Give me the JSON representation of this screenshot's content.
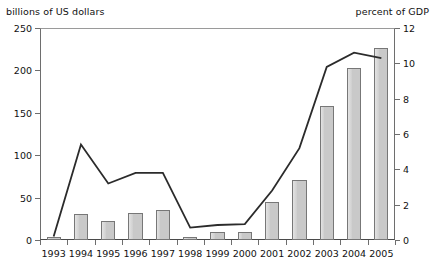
{
  "chart_data": {
    "type": "bar",
    "title": "",
    "categories": [
      "1993",
      "1994",
      "1995",
      "1996",
      "1997",
      "1998",
      "1999",
      "2000",
      "2001",
      "2002",
      "2003",
      "2004",
      "2005"
    ],
    "xlabel": "",
    "ylabel": "billions of US dollars",
    "y2label": "percent of GDP",
    "ylim": [
      0,
      250
    ],
    "y2lim": [
      0,
      12
    ],
    "yticks": [
      0,
      50,
      100,
      150,
      200,
      250
    ],
    "y2ticks": [
      0,
      2,
      4,
      6,
      8,
      10,
      12
    ],
    "grid": false,
    "legend": "none",
    "series": [
      {
        "name": "billions of US dollars",
        "render": "bar",
        "axis": "left",
        "color": "#c9c9c9",
        "values": [
          3,
          31,
          22,
          32,
          35,
          4,
          9,
          10,
          45,
          71,
          158,
          203,
          227
        ]
      },
      {
        "name": "percent of GDP",
        "render": "line",
        "axis": "right",
        "color": "#2b2b2b",
        "values": [
          0.2,
          5.4,
          3.2,
          3.8,
          3.8,
          0.7,
          0.85,
          0.9,
          2.8,
          5.2,
          9.8,
          10.6,
          10.3
        ]
      }
    ]
  },
  "header": {
    "left_axis_title": "billions of US dollars",
    "right_axis_title": "percent of GDP"
  }
}
